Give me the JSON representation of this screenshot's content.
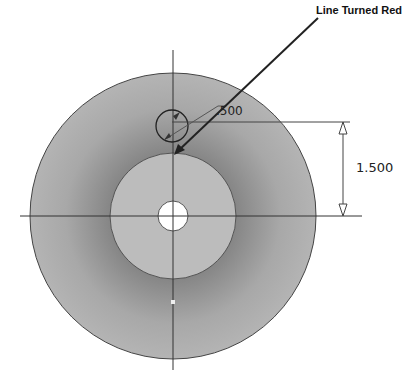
{
  "drawing": {
    "annotation": "Line Turned Red",
    "dimension_diameter": ".500",
    "dimension_offset": "1.500",
    "colors": {
      "outer_fill": "#a9a9a9",
      "inner_fill": "#bcbcbc",
      "hole_fill": "#ffffff",
      "line": "#333333",
      "background": "#ffffff"
    },
    "shapes": {
      "outer_circle": {
        "cx": 173,
        "cy": 216,
        "r": 143
      },
      "inner_circle": {
        "cx": 173,
        "cy": 216,
        "r": 63
      },
      "center_hole": {
        "cx": 173,
        "cy": 216,
        "r": 15
      },
      "small_circle": {
        "cx": 172,
        "cy": 126,
        "r": 16
      }
    }
  }
}
